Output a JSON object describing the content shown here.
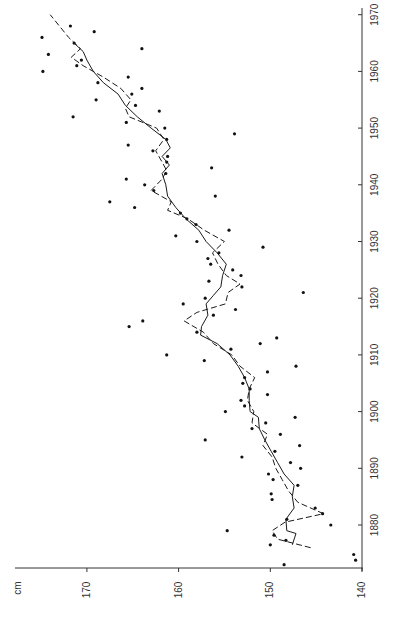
{
  "chart_data": {
    "type": "scatter",
    "title": "",
    "orientation": "rotated 90° counter-clockwise (year axis vertical on right, cm axis horizontal at bottom)",
    "xlabel": "",
    "ylabel": "cm",
    "x_axis": {
      "label": "",
      "range": [
        1872,
        1971
      ],
      "ticks": [
        1880,
        1890,
        1900,
        1910,
        1920,
        1930,
        1940,
        1950,
        1960,
        1970
      ],
      "tick_labels": [
        "1880",
        "1890",
        "1900",
        "1910",
        "1920",
        "1930",
        "1940",
        "1950",
        "1960",
        "1970"
      ]
    },
    "y_axis": {
      "label": "cm",
      "range": [
        140,
        178
      ],
      "ticks": [
        140,
        150,
        160,
        170
      ],
      "tick_labels": [
        "140",
        "150",
        "160",
        "170"
      ]
    },
    "grid": false,
    "legend": null,
    "series": [
      {
        "name": "observations",
        "style": "dots",
        "points": [
          [
            1873.0,
            148.5
          ],
          [
            1873.8,
            140.7
          ],
          [
            1874.8,
            140.9
          ],
          [
            1876.5,
            150.0
          ],
          [
            1877.3,
            148.3
          ],
          [
            1878.2,
            149.6
          ],
          [
            1879.0,
            154.7
          ],
          [
            1880.0,
            143.4
          ],
          [
            1881.0,
            148.2
          ],
          [
            1882.0,
            144.3
          ],
          [
            1883.0,
            145.1
          ],
          [
            1884.5,
            149.8
          ],
          [
            1885.5,
            149.9
          ],
          [
            1887.0,
            147.0
          ],
          [
            1888.0,
            149.7
          ],
          [
            1889.0,
            150.2
          ],
          [
            1890.0,
            146.7
          ],
          [
            1891.0,
            147.8
          ],
          [
            1892.0,
            153.1
          ],
          [
            1893.0,
            149.5
          ],
          [
            1894.0,
            146.8
          ],
          [
            1895.0,
            157.1
          ],
          [
            1896.0,
            148.9
          ],
          [
            1897.0,
            152.0
          ],
          [
            1898.0,
            150.5
          ],
          [
            1899.0,
            147.3
          ],
          [
            1900.0,
            154.9
          ],
          [
            1901.0,
            152.8
          ],
          [
            1902.0,
            153.2
          ],
          [
            1903.0,
            150.3
          ],
          [
            1904.0,
            152.2
          ],
          [
            1905.0,
            153.0
          ],
          [
            1906.0,
            152.8
          ],
          [
            1907.0,
            150.3
          ],
          [
            1908.0,
            147.2
          ],
          [
            1909.0,
            157.2
          ],
          [
            1910.0,
            161.3
          ],
          [
            1911.0,
            154.3
          ],
          [
            1912.0,
            151.1
          ],
          [
            1913.0,
            149.3
          ],
          [
            1914.0,
            158.0
          ],
          [
            1915.0,
            165.4
          ],
          [
            1916.0,
            163.9
          ],
          [
            1917.0,
            156.2
          ],
          [
            1918.0,
            153.8
          ],
          [
            1919.0,
            159.5
          ],
          [
            1920.0,
            157.1
          ],
          [
            1921.0,
            146.4
          ],
          [
            1922.0,
            153.1
          ],
          [
            1923.0,
            156.7
          ],
          [
            1924.0,
            153.2
          ],
          [
            1925.0,
            154.1
          ],
          [
            1926.0,
            156.5
          ],
          [
            1927.0,
            156.8
          ],
          [
            1928.0,
            155.6
          ],
          [
            1929.0,
            150.8
          ],
          [
            1930.0,
            158.0
          ],
          [
            1931.0,
            160.3
          ],
          [
            1932.0,
            154.5
          ],
          [
            1933.0,
            158.1
          ],
          [
            1934.0,
            159.1
          ],
          [
            1935.0,
            159.8
          ],
          [
            1936.0,
            164.8
          ],
          [
            1937.0,
            167.5
          ],
          [
            1938.0,
            156.0
          ],
          [
            1939.0,
            162.7
          ],
          [
            1940.0,
            163.7
          ],
          [
            1941.0,
            165.7
          ],
          [
            1942.0,
            161.4
          ],
          [
            1943.0,
            156.4
          ],
          [
            1944.0,
            161.3
          ],
          [
            1945.0,
            161.2
          ],
          [
            1946.0,
            162.8
          ],
          [
            1947.0,
            165.5
          ],
          [
            1948.0,
            161.3
          ],
          [
            1949.0,
            153.9
          ],
          [
            1950.0,
            161.5
          ],
          [
            1951.0,
            165.7
          ],
          [
            1952.0,
            171.5
          ],
          [
            1953.0,
            162.1
          ],
          [
            1954.0,
            164.7
          ],
          [
            1955.0,
            169.0
          ],
          [
            1956.0,
            165.1
          ],
          [
            1957.0,
            164.0
          ],
          [
            1958.0,
            168.8
          ],
          [
            1959.0,
            165.5
          ],
          [
            1960.0,
            174.8
          ],
          [
            1961.0,
            171.1
          ],
          [
            1962.0,
            170.6
          ],
          [
            1963.0,
            174.2
          ],
          [
            1964.0,
            164.0
          ],
          [
            1965.0,
            171.4
          ],
          [
            1966.0,
            174.9
          ],
          [
            1967.0,
            169.2
          ],
          [
            1968.0,
            171.8
          ]
        ]
      },
      {
        "name": "moving average (solid)",
        "style": "solid",
        "points": [
          [
            1876.5,
            147.6
          ],
          [
            1878.5,
            147.2
          ],
          [
            1879.0,
            148.2
          ],
          [
            1881.0,
            148.3
          ],
          [
            1883.0,
            147.4
          ],
          [
            1885.0,
            147.6
          ],
          [
            1887.0,
            147.4
          ],
          [
            1889.0,
            148.5
          ],
          [
            1891.0,
            149.2
          ],
          [
            1893.0,
            149.9
          ],
          [
            1895.0,
            150.6
          ],
          [
            1897.0,
            151.2
          ],
          [
            1899.0,
            151.3
          ],
          [
            1900.0,
            152.2
          ],
          [
            1902.0,
            152.3
          ],
          [
            1904.0,
            152.3
          ],
          [
            1906.0,
            152.8
          ],
          [
            1908.0,
            153.5
          ],
          [
            1910.0,
            154.4
          ],
          [
            1912.0,
            155.8
          ],
          [
            1913.5,
            157.6
          ],
          [
            1915.0,
            157.5
          ],
          [
            1917.0,
            156.8
          ],
          [
            1919.0,
            157.0
          ],
          [
            1920.5,
            156.2
          ],
          [
            1922.0,
            155.4
          ],
          [
            1924.0,
            155.2
          ],
          [
            1926.0,
            154.8
          ],
          [
            1928.0,
            155.8
          ],
          [
            1930.0,
            157.0
          ],
          [
            1932.0,
            157.8
          ],
          [
            1934.0,
            159.2
          ],
          [
            1936.0,
            160.3
          ],
          [
            1938.0,
            161.2
          ],
          [
            1940.0,
            161.4
          ],
          [
            1942.0,
            161.8
          ],
          [
            1943.5,
            161.0
          ],
          [
            1945.0,
            161.8
          ],
          [
            1946.5,
            160.9
          ],
          [
            1948.0,
            161.4
          ],
          [
            1950.0,
            163.0
          ],
          [
            1952.0,
            164.5
          ],
          [
            1954.0,
            165.8
          ],
          [
            1956.0,
            166.6
          ],
          [
            1958.0,
            168.2
          ],
          [
            1960.0,
            169.3
          ],
          [
            1962.0,
            170.0
          ],
          [
            1963.5,
            170.4
          ],
          [
            1965.0,
            171.4
          ]
        ]
      },
      {
        "name": "moving average (dashed)",
        "style": "dashed",
        "points": [
          [
            1876.0,
            145.6
          ],
          [
            1877.5,
            149.2
          ],
          [
            1879.0,
            149.8
          ],
          [
            1880.5,
            148.4
          ],
          [
            1882.0,
            144.2
          ],
          [
            1884.0,
            147.0
          ],
          [
            1886.0,
            148.0
          ],
          [
            1888.0,
            148.7
          ],
          [
            1890.0,
            149.4
          ],
          [
            1892.0,
            149.8
          ],
          [
            1894.0,
            150.8
          ],
          [
            1896.0,
            150.3
          ],
          [
            1898.0,
            152.0
          ],
          [
            1900.0,
            151.8
          ],
          [
            1902.0,
            152.5
          ],
          [
            1904.0,
            152.3
          ],
          [
            1906.0,
            151.7
          ],
          [
            1908.0,
            153.3
          ],
          [
            1910.0,
            154.2
          ],
          [
            1912.0,
            156.2
          ],
          [
            1914.0,
            157.3
          ],
          [
            1916.0,
            159.4
          ],
          [
            1917.5,
            158.0
          ],
          [
            1919.0,
            154.9
          ],
          [
            1921.0,
            154.6
          ],
          [
            1922.5,
            153.3
          ],
          [
            1924.0,
            154.8
          ],
          [
            1926.0,
            155.7
          ],
          [
            1928.0,
            156.3
          ],
          [
            1930.0,
            155.0
          ],
          [
            1932.0,
            157.2
          ],
          [
            1934.0,
            159.0
          ],
          [
            1935.5,
            161.2
          ],
          [
            1937.0,
            160.8
          ],
          [
            1939.0,
            163.0
          ],
          [
            1941.0,
            161.8
          ],
          [
            1942.5,
            161.3
          ],
          [
            1944.0,
            161.8
          ],
          [
            1946.0,
            162.5
          ],
          [
            1948.0,
            161.6
          ],
          [
            1950.0,
            162.4
          ],
          [
            1952.0,
            165.4
          ],
          [
            1953.5,
            165.8
          ],
          [
            1955.0,
            165.2
          ],
          [
            1957.0,
            166.3
          ],
          [
            1959.0,
            168.2
          ],
          [
            1961.0,
            170.4
          ],
          [
            1962.5,
            171.7
          ],
          [
            1964.0,
            170.7
          ],
          [
            1966.0,
            172.0
          ],
          [
            1968.0,
            173.0
          ],
          [
            1970.0,
            174.0
          ]
        ]
      }
    ]
  },
  "axes": {
    "unit_label": "cm",
    "cm_ticks": [
      "140",
      "150",
      "160",
      "170"
    ],
    "year_ticks": [
      "1880",
      "1890",
      "1900",
      "1910",
      "1920",
      "1930",
      "1940",
      "1950",
      "1960",
      "1970"
    ]
  }
}
